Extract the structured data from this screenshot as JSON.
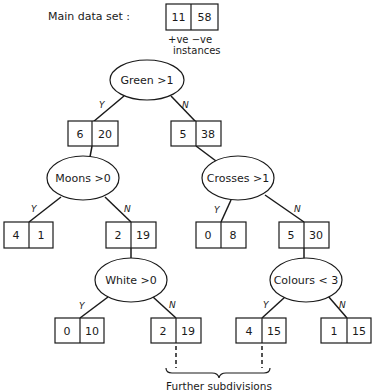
{
  "legend": {
    "main_label": "Main data set :",
    "main_pos": "11",
    "main_neg": "58",
    "col_labels": "+ve  −ve",
    "instances": "instances"
  },
  "branch_labels": {
    "yes": "Y",
    "no": "N"
  },
  "tests": {
    "green": "Green  >1",
    "moons": "Moons  >0",
    "crosses": "Crosses >1",
    "white": "White  >0",
    "colours": "Colours < 3"
  },
  "counts": {
    "green_y": {
      "pos": "6",
      "neg": "20"
    },
    "green_n": {
      "pos": "5",
      "neg": "38"
    },
    "moons_y": {
      "pos": "4",
      "neg": "1"
    },
    "moons_n": {
      "pos": "2",
      "neg": "19"
    },
    "crosses_y": {
      "pos": "0",
      "neg": "8"
    },
    "crosses_n": {
      "pos": "5",
      "neg": "30"
    },
    "white_y": {
      "pos": "0",
      "neg": "10"
    },
    "white_n": {
      "pos": "2",
      "neg": "19"
    },
    "colours_y": {
      "pos": "4",
      "neg": "15"
    },
    "colours_n": {
      "pos": "1",
      "neg": "15"
    }
  },
  "footer": {
    "further": "Further subdivisions"
  }
}
